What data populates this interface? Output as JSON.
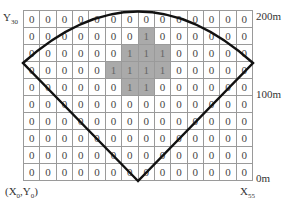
{
  "labels": {
    "y_top": "Y",
    "y_top_sub": "30",
    "origin": "(X",
    "origin_sub0": "0",
    "origin_mid": ",Y",
    "origin_sub1": "0",
    "origin_end": ")",
    "x_right": "X",
    "x_right_sub": "55",
    "dist_200": "200m",
    "dist_100": "100m",
    "dist_0": "0m"
  },
  "grid": {
    "columns": 14,
    "rows": 10,
    "colors": {
      "zero_cell": "#ffffff",
      "one_cell": "#aaaaaa",
      "border": "#9a9a9a",
      "fan_line": "#111111"
    },
    "cells": [
      [
        0,
        0,
        0,
        0,
        0,
        0,
        0,
        0,
        0,
        0,
        0,
        0,
        0,
        0
      ],
      [
        0,
        0,
        0,
        0,
        0,
        0,
        0,
        1,
        0,
        0,
        0,
        0,
        0,
        0
      ],
      [
        0,
        0,
        0,
        0,
        0,
        0,
        1,
        1,
        1,
        0,
        0,
        0,
        0,
        0
      ],
      [
        0,
        0,
        0,
        0,
        0,
        1,
        1,
        1,
        1,
        0,
        0,
        0,
        0,
        0
      ],
      [
        0,
        0,
        0,
        0,
        0,
        0,
        1,
        1,
        0,
        0,
        0,
        0,
        0,
        0
      ],
      [
        0,
        0,
        0,
        0,
        0,
        0,
        0,
        0,
        0,
        0,
        0,
        0,
        0,
        0
      ],
      [
        0,
        0,
        0,
        0,
        0,
        0,
        0,
        0,
        0,
        0,
        0,
        0,
        0,
        0
      ],
      [
        0,
        0,
        0,
        0,
        0,
        0,
        0,
        0,
        0,
        0,
        0,
        0,
        0,
        0
      ],
      [
        0,
        0,
        0,
        0,
        0,
        0,
        0,
        0,
        0,
        0,
        0,
        0,
        0,
        0
      ],
      [
        0,
        0,
        0,
        0,
        0,
        0,
        0,
        0,
        0,
        0,
        0,
        0,
        0,
        0
      ]
    ]
  },
  "fan_shape": {
    "description": "sector outline with apex at bottom center and arc across the top",
    "apex": "bottom-center",
    "left_vertex": "left edge at ~row 3/4 boundary",
    "right_vertex": "right edge at ~row 3/4 boundary"
  }
}
